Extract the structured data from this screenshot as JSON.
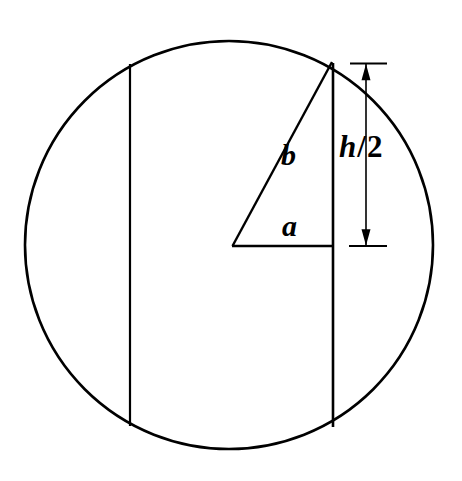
{
  "figure": {
    "background_color": "#ffffff",
    "stroke_color": "#000000",
    "labels": {
      "leg_horizontal": "a",
      "hypotenuse": "b",
      "dimension": "h/2",
      "dimension_var": "h",
      "dimension_slash": "/",
      "dimension_num": "2"
    }
  },
  "chart_data": {
    "type": "diagram",
    "canvas": {
      "width": 462,
      "height": 481
    },
    "circle": {
      "center_x": 229,
      "center_y": 245,
      "radius": 204,
      "stroke_width": 2.6
    },
    "chords": [
      {
        "name": "left-chord",
        "x": 130,
        "y_top": 64,
        "y_bottom": 426,
        "stroke_width": 2.2
      },
      {
        "name": "right-chord",
        "x": 333,
        "y_top": 63,
        "y_bottom": 427,
        "stroke_width": 2.6
      }
    ],
    "triangle": {
      "name": "right-triangle",
      "vertex_center": {
        "x": 233,
        "y": 246
      },
      "vertex_apex": {
        "x": 332,
        "y": 63
      },
      "vertex_corner": {
        "x": 333,
        "y": 246
      },
      "leg_a_label": "a",
      "leg_a_length_px": 100,
      "hypotenuse_b_label": "b",
      "vertical_leg_label": "h/2",
      "vertical_leg_length_px": 183
    },
    "dimension": {
      "name": "h-over-2-dimension",
      "line_x": 366,
      "y_top": 63,
      "y_bottom": 246,
      "tick_x_start": 350,
      "tick_x_end": 386,
      "arrow_head_size": 9,
      "label": "h/2"
    },
    "labels": [
      {
        "text": "a",
        "x": 295,
        "y": 226,
        "style": "italic-serif-bold"
      },
      {
        "text": "b",
        "x": 292,
        "y": 156,
        "style": "italic-serif-bold"
      },
      {
        "text": "h/2",
        "x": 367,
        "y": 152,
        "style": "italic-serif-bold-mixed"
      }
    ]
  }
}
